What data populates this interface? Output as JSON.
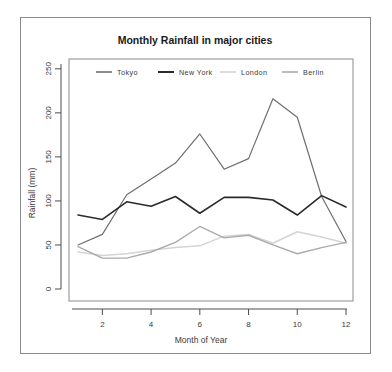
{
  "chart_data": {
    "type": "line",
    "title": "Monthly Rainfall in major cities",
    "xlabel": "Month of Year",
    "ylabel": "Rainfall (mm)",
    "x": [
      1,
      2,
      3,
      4,
      5,
      6,
      7,
      8,
      9,
      10,
      11,
      12
    ],
    "xlim": [
      1,
      12
    ],
    "ylim": [
      0,
      260
    ],
    "xticks": [
      2,
      4,
      6,
      8,
      10,
      12
    ],
    "xtick_labels": [
      "2",
      "4",
      "6",
      "8",
      "10",
      "12"
    ],
    "yticks": [
      0,
      50,
      100,
      150,
      200,
      250
    ],
    "ytick_labels": [
      "0",
      "50",
      "100",
      "150",
      "200",
      "250"
    ],
    "grid": false,
    "legend_position": "top-inside",
    "series": [
      {
        "name": "Tokyo",
        "color": "#6e6e6e",
        "width": 1.2,
        "values": [
          50,
          62,
          107,
          125,
          143,
          176,
          136,
          148,
          216,
          195,
          105,
          54
        ]
      },
      {
        "name": "New York",
        "color": "#2b2b2b",
        "width": 1.6,
        "values": [
          84,
          79,
          99,
          94,
          105,
          86,
          104,
          104,
          101,
          84,
          106,
          93
        ]
      },
      {
        "name": "London",
        "color": "#d4d4d4",
        "width": 1.5,
        "values": [
          42,
          38,
          40,
          44,
          47,
          49,
          60,
          62,
          52,
          65,
          59,
          52
        ]
      },
      {
        "name": "Berlin",
        "color": "#ababab",
        "width": 1.4,
        "values": [
          48,
          35,
          35,
          42,
          53,
          71,
          58,
          61,
          50,
          40,
          47,
          53
        ]
      }
    ]
  },
  "axis": {
    "y_title": "Rainfall (mm)",
    "x_title": "Month of Year"
  },
  "legend": {
    "entries": [
      {
        "label": "Tokyo",
        "color": "#6e6e6e"
      },
      {
        "label": "New York",
        "color": "#2b2b2b"
      },
      {
        "label": "London",
        "color": "#d4d4d4"
      },
      {
        "label": "Berlin",
        "color": "#ababab"
      }
    ]
  }
}
